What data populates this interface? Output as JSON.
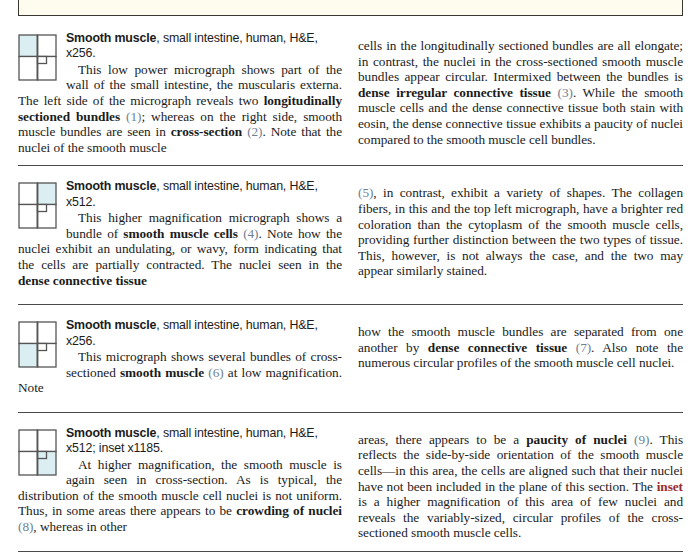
{
  "page": {
    "figure_box": {
      "fill_color": "#fdfcef",
      "border_color": "#3a3631"
    },
    "ref_color": "#6f7f91",
    "inset_color": "#9a2d2d",
    "thumb_fill": "#dbeef2"
  },
  "entries": [
    {
      "id": "entry-1",
      "thumb_quadrant": "top-left",
      "heading_bold": "Smooth muscle",
      "heading_rest": ", small intestine, human, H&E,",
      "heading_line2": "x256.",
      "left_body": {
        "p1_a": "This low power micrograph shows part of the wall of the small intestine, the muscularis externa. The left side of the micrograph reveals two ",
        "b1": "longitudinally sectioned bundles",
        "p1_b": " ",
        "ref1": "(1)",
        "p1_c": "; whereas on the right side, smooth muscle bundles are seen in ",
        "b2": "cross-section",
        "p1_d": " ",
        "ref2": "(2)",
        "p1_e": ". Note that the nuclei of the smooth muscle"
      },
      "right_body": {
        "t1": "cells in the longitudinally sectioned bundles are all elongate; in contrast, the nuclei in the cross-sectioned smooth muscle bundles appear circular. Intermixed between the bundles is ",
        "b1": "dense irregular connective tissue",
        "t2": " ",
        "ref1": "(3)",
        "t3": ". While the smooth muscle cells and the dense connective tissue both stain with eosin, the dense connective tissue exhibits a paucity of nuclei compared to the smooth muscle cell bundles."
      }
    },
    {
      "id": "entry-2",
      "thumb_quadrant": "top-right",
      "heading_bold": "Smooth muscle",
      "heading_rest": ", small intestine, human, H&E,",
      "heading_line2": "x512.",
      "left_body": {
        "p1_a": "This higher magnification micrograph shows a bundle of ",
        "b1": "smooth muscle cells",
        "p1_b": " ",
        "ref1": "(4)",
        "p1_c": ". Note how the nuclei exhibit an undulating, or wavy, form indicating that the cells are partially contracted. The nuclei seen in the ",
        "b2": "dense connective tissue"
      },
      "right_body": {
        "ref1": "(5)",
        "t1": ", in contrast, exhibit a variety of shapes. The collagen fibers, in this and the top left micrograph, have a brighter red coloration than the cytoplasm of the smooth muscle cells, providing further distinction between the two types of tissue. This, however, is not always the case, and the two may appear similarly stained."
      }
    },
    {
      "id": "entry-3",
      "thumb_quadrant": "bottom-left",
      "heading_bold": "Smooth muscle",
      "heading_rest": ", small intestine, human, H&E,",
      "heading_line2": "x256.",
      "left_body": {
        "p1_a": "This micrograph shows several bundles of cross-sectioned ",
        "b1": "smooth muscle",
        "p1_b": " ",
        "ref1": "(6)",
        "p1_c": " at low magnification. Note"
      },
      "right_body": {
        "t1": "how the smooth muscle bundles are separated from one another by ",
        "b1": "dense connective tissue",
        "t2": " ",
        "ref1": "(7)",
        "t3": ". Also note the numerous circular profiles of the smooth muscle cell nuclei."
      }
    },
    {
      "id": "entry-4",
      "thumb_quadrant": "bottom-right",
      "heading_bold": "Smooth muscle",
      "heading_rest": ", small intestine, human, H&E,",
      "heading_line2": "x512; inset x1185.",
      "left_body": {
        "p1_a": "At higher magnification, the smooth muscle is again seen in cross-section. As is typical, the distribution of the smooth muscle cell nuclei is not uniform. Thus, in some areas there appears to be ",
        "b1": "crowding of nuclei",
        "p1_b": " ",
        "ref1": "(8)",
        "p1_c": ", whereas in other"
      },
      "right_body": {
        "t1": "areas, there appears to be a ",
        "b1": "paucity of nuclei",
        "t2": " ",
        "ref1": "(9)",
        "t3": ". This reflects the side-by-side orientation of the smooth muscle cells—in this area, the cells are aligned such that their nuclei have not been included in the plane of this section. The ",
        "inset": "inset",
        "t4": " is a higher magnification of this area of few nuclei and reveals the variably-sized, circular profiles of the cross-sectioned smooth muscle cells."
      }
    }
  ]
}
